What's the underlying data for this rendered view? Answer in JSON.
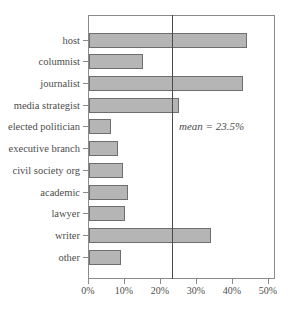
{
  "chart_data": {
    "type": "bar",
    "orientation": "horizontal",
    "title": "",
    "xlabel": "",
    "ylabel": "",
    "categories": [
      "host",
      "columnist",
      "journalist",
      "media strategist",
      "elected politician",
      "executive branch",
      "civil society org",
      "academic",
      "lawyer",
      "writer",
      "other"
    ],
    "values": [
      44,
      15,
      43,
      25,
      6,
      8,
      9.5,
      11,
      10,
      34,
      9
    ],
    "value_unit": "%",
    "xlim": [
      0,
      52
    ],
    "x_ticks": [
      {
        "value": 0,
        "label": "0%"
      },
      {
        "value": 10,
        "label": "10%"
      },
      {
        "value": 20,
        "label": "20%"
      },
      {
        "value": 30,
        "label": "30%"
      },
      {
        "value": 40,
        "label": "40%"
      },
      {
        "value": 50,
        "label": "50%"
      }
    ],
    "grid": "off",
    "legend": "none",
    "mean_line": {
      "value": 23.5,
      "label": "mean = 23.5%"
    },
    "colors": {
      "bar_fill": "#b5b5b5",
      "bar_border": "#6e6e6e",
      "axis": "#8a8a8a",
      "mean_line": "#4a4a4a",
      "text": "#4d4d4d",
      "background": "#ffffff"
    }
  }
}
